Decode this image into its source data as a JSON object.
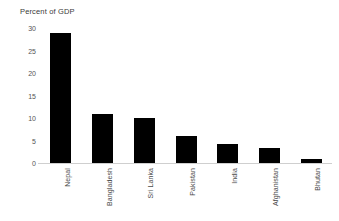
{
  "chart_data": {
    "type": "bar",
    "title": "Percent of GDP",
    "xlabel": "",
    "ylabel": "",
    "categories": [
      "Nepal",
      "Bangladesh",
      "Sri Lanka",
      "Pakistan",
      "India",
      "Afghanistan",
      "Bhutan"
    ],
    "values": [
      29,
      11,
      10,
      6,
      4.3,
      3.4,
      1
    ],
    "ylim": [
      0,
      30
    ],
    "yticks": [
      0,
      5,
      10,
      15,
      20,
      25,
      30
    ],
    "ytick_labels": [
      "0",
      "5",
      "10",
      "15",
      "20",
      "25",
      "30"
    ],
    "grid": false,
    "legend": false,
    "bar_color": "#000000",
    "axis_color": "#cfcfcf",
    "text_color": "#4a4a4a"
  }
}
